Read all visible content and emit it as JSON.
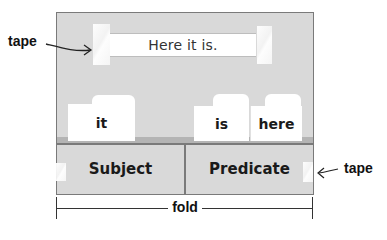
{
  "diagram": {
    "sentence_strip": {
      "text": "Here it is."
    },
    "cards": [
      {
        "label": "it"
      },
      {
        "label": "is"
      },
      {
        "label": "here"
      }
    ],
    "panels": [
      {
        "label": "Subject"
      },
      {
        "label": "Predicate"
      }
    ],
    "callouts": {
      "top_left": "tape",
      "bottom_right": "tape"
    },
    "fold_label": "fold"
  },
  "colors": {
    "board": "#d9d9d9",
    "border": "#7a7a7a",
    "card": "#ffffff",
    "text": "#1a1a1a"
  }
}
